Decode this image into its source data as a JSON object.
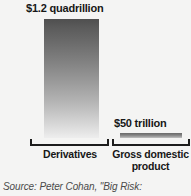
{
  "chart_data": {
    "type": "bar",
    "title": "",
    "categories": [
      "Derivatives",
      "Gross domestic product"
    ],
    "values": [
      1200000000000000,
      50000000000000
    ],
    "value_labels": [
      "$1.2 quadrillion",
      "$50 trillion"
    ],
    "xlabel": "",
    "ylabel": "",
    "ylim": [
      0,
      1200000000000000
    ],
    "grid": false,
    "legend": null,
    "orientation": "vertical",
    "units": "US dollars",
    "series": [
      {
        "name": "Notional value",
        "values": [
          1200000000000000,
          50000000000000
        ]
      }
    ]
  },
  "figure": {
    "bars": [
      {
        "id": "derivatives",
        "value_label": "$1.2 quadrillion",
        "category_label": "Derivatives"
      },
      {
        "id": "gdp",
        "value_label": "$50 trillion",
        "category_label": "Gross domestic product"
      }
    ],
    "source": "Source: Peter Cohan, \"Big Risk:"
  },
  "colors": {
    "background": "#f4f4f3",
    "text": "#171717",
    "axis": "#1c1c1c",
    "bar_top": "#4f4f4f",
    "bar_bottom": "#eeeeee",
    "source_text": "#4a4a4a"
  }
}
